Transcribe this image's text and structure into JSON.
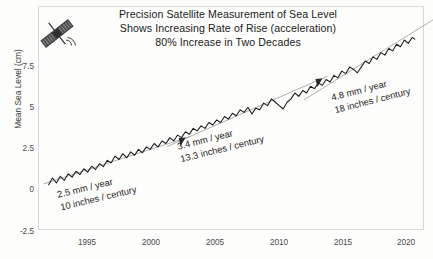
{
  "title": {
    "line1": "Precision Satellite Measurement of Sea Level",
    "line2": "Shows Increasing Rate of Rise (acceleration)",
    "line3": "80% Increase in Two Decades"
  },
  "icons": {
    "satellite": "satellite-icon",
    "marker": "triangle-marker-icon"
  },
  "chart_data": {
    "type": "line",
    "title": "Precision Satellite Measurement of Sea Level Shows Increasing Rate of Rise (acceleration) 80% Increase in Two Decades",
    "xlabel": "",
    "ylabel": "Mean Sea Level (cm)",
    "xlim": [
      1992.8,
      2021.5
    ],
    "ylim": [
      -2.9,
      9.4
    ],
    "xticks": [
      1995,
      2000,
      2005,
      2010,
      2015,
      2020
    ],
    "xticklabels": [
      "1995",
      "2000",
      "2005",
      "2010",
      "2015",
      "2020"
    ],
    "yticks": [
      -2.5,
      0,
      2.5,
      5,
      7.5
    ],
    "yticklabels": [
      "-2.5",
      "0",
      "2.5",
      "5",
      "7.5"
    ],
    "grid": false,
    "legend": null,
    "series": [
      {
        "name": "Mean Sea Level",
        "units": "cm",
        "x": [
          1993.0,
          1993.3,
          1993.6,
          1993.9,
          1994.2,
          1994.5,
          1994.8,
          1995.1,
          1995.4,
          1995.7,
          1996.0,
          1996.3,
          1996.6,
          1996.9,
          1997.2,
          1997.5,
          1997.8,
          1998.1,
          1998.4,
          1998.7,
          1999.0,
          1999.3,
          1999.6,
          1999.9,
          2000.2,
          2000.5,
          2000.8,
          2001.1,
          2001.4,
          2001.7,
          2002.0,
          2002.3,
          2002.6,
          2002.9,
          2003.2,
          2003.5,
          2003.8,
          2004.1,
          2004.4,
          2004.7,
          2005.0,
          2005.3,
          2005.6,
          2005.9,
          2006.2,
          2006.5,
          2006.8,
          2007.1,
          2007.4,
          2007.7,
          2008.0,
          2008.3,
          2008.6,
          2008.9,
          2009.2,
          2009.5,
          2009.8,
          2010.1,
          2010.4,
          2010.7,
          2011.0,
          2011.3,
          2011.6,
          2011.9,
          2012.2,
          2012.5,
          2012.8,
          2013.1,
          2013.4,
          2013.7,
          2014.0,
          2014.3,
          2014.6,
          2014.9,
          2015.2,
          2015.5,
          2015.8,
          2016.1,
          2016.4,
          2016.7,
          2017.0,
          2017.3,
          2017.6,
          2017.9,
          2018.2,
          2018.5,
          2018.8,
          2019.1,
          2019.4,
          2019.7,
          2020.0,
          2020.3,
          2020.6,
          2020.9,
          2021.1
        ],
        "y": [
          -0.15,
          0.25,
          -0.05,
          0.35,
          0.1,
          0.5,
          0.3,
          0.65,
          0.45,
          0.8,
          0.6,
          0.95,
          0.75,
          1.1,
          0.92,
          1.3,
          1.15,
          1.55,
          1.35,
          1.7,
          1.45,
          1.8,
          1.6,
          1.95,
          1.75,
          2.1,
          1.95,
          2.3,
          2.1,
          2.45,
          2.3,
          2.65,
          2.45,
          2.8,
          2.65,
          3.0,
          2.85,
          3.2,
          3.05,
          3.35,
          3.2,
          3.55,
          3.4,
          3.7,
          3.55,
          3.9,
          3.75,
          4.1,
          3.95,
          4.3,
          4.15,
          4.45,
          4.05,
          4.4,
          4.3,
          4.7,
          4.55,
          4.95,
          4.75,
          4.55,
          4.35,
          4.75,
          4.95,
          5.3,
          5.1,
          5.45,
          5.3,
          5.7,
          5.55,
          5.9,
          5.75,
          6.1,
          5.95,
          6.35,
          6.2,
          6.6,
          6.45,
          6.85,
          6.7,
          6.5,
          6.85,
          7.2,
          7.05,
          7.45,
          7.3,
          7.7,
          7.55,
          7.95,
          7.8,
          8.2,
          8.05,
          8.45,
          8.25,
          8.6,
          8.5
        ]
      }
    ],
    "trend_segments": [
      {
        "label_rate": "2.5 mm / year",
        "label_rate_alt": "10 inches / century",
        "slope_mm_per_year": 2.5,
        "slope_inches_per_century": 10,
        "x_start": 1993.0,
        "x_end": 2002.5
      },
      {
        "label_rate": "3.4 mm / year",
        "label_rate_alt": "13.3 inches / century",
        "slope_mm_per_year": 3.4,
        "slope_inches_per_century": 13.3,
        "x_start": 2002.5,
        "x_end": 2013.0
      },
      {
        "label_rate": "4.8 mm / year",
        "label_rate_alt": "18 inches / century",
        "slope_mm_per_year": 4.8,
        "slope_inches_per_century": 18,
        "x_start": 2013.0,
        "x_end": 2021.1
      }
    ]
  },
  "annotations": [
    {
      "rate": "2.5 mm / year",
      "rate_alt": "10 inches / century"
    },
    {
      "rate": "3.4 mm / year",
      "rate_alt": "13.3 inches / century"
    },
    {
      "rate": "4.8 mm / year",
      "rate_alt": "18 inches / century"
    }
  ],
  "colors": {
    "data_line": "#1a1a1a",
    "trend_line": "#9a9a9a",
    "frame": "#d8d8d4",
    "text": "#1b1b1b",
    "tick_text": "#4a4a4a",
    "background": "#fdfdfb"
  }
}
